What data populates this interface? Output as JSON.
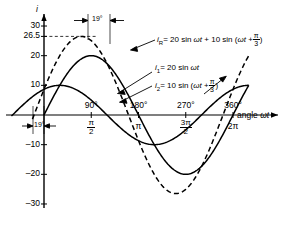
{
  "figure": {
    "type": "waveform-plot",
    "y_axis_label": "i",
    "x_axis_label": "angle",
    "x_axis_label_var": "ωt",
    "line_color": "#000000"
  },
  "y_ticks": [
    {
      "label": "30",
      "value": 30
    },
    {
      "label": "26.5",
      "value": 26.5
    },
    {
      "label": "20",
      "value": 20
    },
    {
      "label": "10",
      "value": 10
    },
    {
      "label": "–10",
      "value": -10
    },
    {
      "label": "–20",
      "value": -20
    },
    {
      "label": "–30",
      "value": -30
    }
  ],
  "x_ticks_deg": [
    {
      "label": "90°",
      "value": 90
    },
    {
      "label": "180°",
      "value": 180
    },
    {
      "label": "270°",
      "value": 270
    },
    {
      "label": "360°",
      "value": 360
    }
  ],
  "x_ticks_rad": [
    {
      "num": "π",
      "den": "2",
      "value": 90
    },
    {
      "whole": "π",
      "value": 180
    },
    {
      "num": "3π",
      "den": "2",
      "value": 270
    },
    {
      "whole": "2π",
      "value": 360
    }
  ],
  "phase_marker": {
    "label": "19°",
    "value_deg": 19,
    "occurrences": 2
  },
  "annotations": {
    "resultant": {
      "symbol": "i",
      "subscript": "R",
      "equals": "= 20 sin",
      "var1": "ωt",
      "plus": "+ 10 sin (",
      "var2": "ωt",
      "plus2": "+",
      "frac_num": "π",
      "frac_den": "3",
      "close": ")"
    },
    "i1": {
      "symbol": "i",
      "subscript": "1",
      "equals": "= 20 sin",
      "var1": "ωt"
    },
    "i2": {
      "symbol": "i",
      "subscript": "2",
      "equals": "= 10 sin (",
      "var1": "ωt",
      "plus": "+",
      "frac_num": "π",
      "frac_den": "3",
      "close": ")"
    }
  },
  "chart_data": {
    "type": "line",
    "title": "",
    "xlabel": "angle ωt",
    "ylabel": "i",
    "xlim": [
      -60,
      390
    ],
    "ylim": [
      -33,
      33
    ],
    "grid": false,
    "legend": "inline-annotations",
    "x_unit": "degrees",
    "series": [
      {
        "name": "i1 = 20 sin ωt",
        "amplitude": 20,
        "phase_deg": 0,
        "style": "solid",
        "color": "#000000"
      },
      {
        "name": "i2 = 10 sin (ωt + π/3)",
        "amplitude": 10,
        "phase_deg": 60,
        "style": "solid",
        "color": "#000000"
      },
      {
        "name": "iR = 20 sin ωt + 10 sin (ωt + π/3)",
        "amplitude": 26.5,
        "phase_deg": 19,
        "style": "dashed",
        "color": "#000000"
      }
    ]
  }
}
